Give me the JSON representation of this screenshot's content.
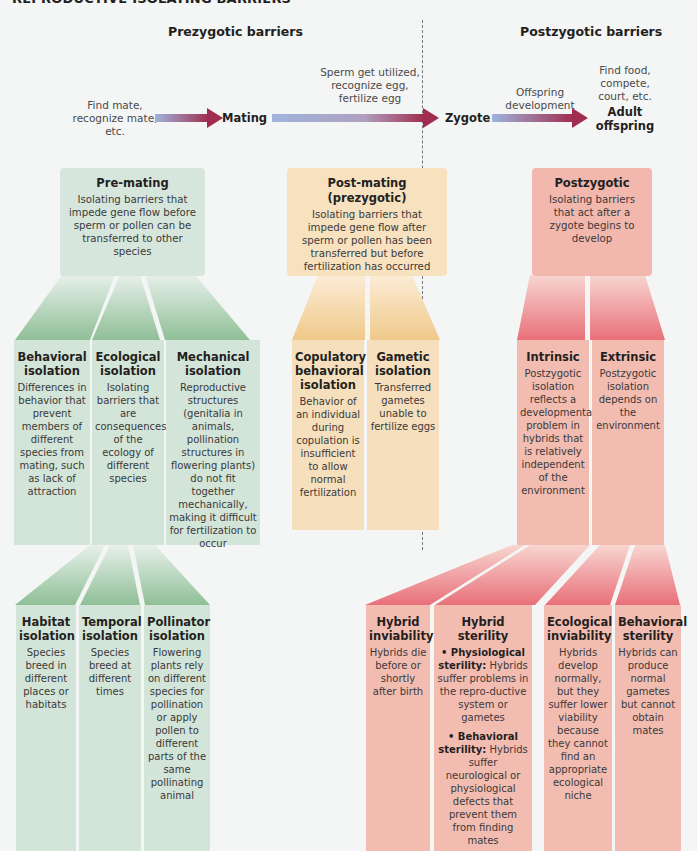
{
  "title": "REPRODUCTIVE ISOLATING BARRIERS",
  "sections": {
    "prezygotic": "Prezygotic barriers",
    "postzygotic": "Postzygotic barriers"
  },
  "flow": {
    "step1_text": [
      "Find mate,",
      "recognize mate,",
      "etc."
    ],
    "node1": "Mating",
    "step2_text": [
      "Sperm get utilized,",
      "recognize egg,",
      "fertilize egg"
    ],
    "node2": "Zygote",
    "step3_text": [
      "Offspring",
      "development"
    ],
    "step4_text": [
      "Find food,",
      "compete,",
      "court, etc."
    ],
    "node3": [
      "Adult",
      "offspring"
    ]
  },
  "categories": [
    {
      "title": "Pre-mating",
      "description": "Isolating barriers that impede gene flow before sperm or pollen can be transferred to other species",
      "color": "#d7e6dc"
    },
    {
      "title": "Post-mating (prezygotic)",
      "description": "Isolating barriers that impede gene flow after sperm or pollen has been transferred but before fertilization has occurred",
      "color": "#f7e1bf"
    },
    {
      "title": "Postzygotic",
      "description": "Isolating barriers that act after a zygote begins to develop",
      "color": "#f2b8ad"
    }
  ],
  "level2": {
    "premating": [
      {
        "title": "Behavioral isolation",
        "description": "Differences in behavior that prevent members of different species from mating, such as lack of attraction"
      },
      {
        "title": "Ecological isolation",
        "description": "Isolating barriers that are consequences of the ecology of different species"
      },
      {
        "title": "Mechanical isolation",
        "description": "Reproductive structures (genitalia in animals, pollination structures in flowering plants) do not fit together mechanically, making it difficult for fertilization to occur"
      }
    ],
    "postmating": [
      {
        "title": "Copulatory behavioral isolation",
        "description": "Behavior of an individual during copulation is insufficient to allow normal fertilization"
      },
      {
        "title": "Gametic isolation",
        "description": "Transferred gametes unable to fertilize eggs"
      }
    ],
    "postzygotic": [
      {
        "title": "Intrinsic",
        "description": "Postzygotic isolation reflects a developmental problem in hybrids that is relatively independent of the environment"
      },
      {
        "title": "Extrinsic",
        "description": "Postzygotic isolation depends on the environment"
      }
    ]
  },
  "level3": {
    "ecological": [
      {
        "title": "Habitat isolation",
        "description": "Species breed in different places or habitats"
      },
      {
        "title": "Temporal isolation",
        "description": "Species breed at different times"
      },
      {
        "title": "Pollinator isolation",
        "description": "Flowering plants rely on different species for pollination or apply pollen to different parts of the same pollinating animal"
      }
    ],
    "intrinsic": [
      {
        "title": "Hybrid inviability",
        "description": "Hybrids die before or shortly after birth"
      },
      {
        "title": "Hybrid sterility",
        "bullets": [
          {
            "label": "• Physiological sterility:",
            "text": "Hybrids suffer problems in the repro-ductive system or gametes"
          },
          {
            "label": "• Behavioral sterility:",
            "text": "Hybrids suffer neurological or physiological defects that prevent them from finding mates"
          }
        ]
      }
    ],
    "extrinsic": [
      {
        "title": "Ecological inviability",
        "description": "Hybrids develop normally, but they suffer lower viability because they cannot find an appropriate ecological niche"
      },
      {
        "title": "Behavioral sterility",
        "description": "Hybrids can produce normal gametes but cannot obtain mates"
      }
    ]
  },
  "colors": {
    "green": "#d7e6dc",
    "green_dark": "#8fbf96",
    "orange": "#f7e1bf",
    "orange_dark": "#f0c98a",
    "red": "#f2b8ad",
    "red_dark": "#e8707a",
    "arrow_start": "#9fb4dc",
    "arrow_end": "#a02c4f"
  }
}
